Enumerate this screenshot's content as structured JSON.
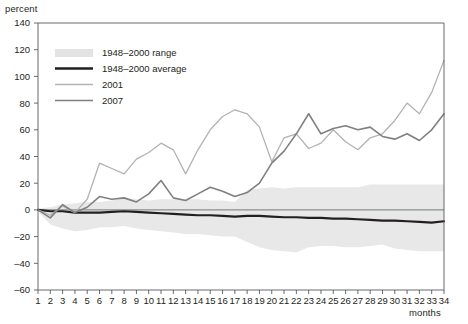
{
  "chart_data": {
    "type": "line",
    "title": "",
    "xlabel": "months",
    "ylabel": "percent",
    "ylim": [
      -60,
      140
    ],
    "xlim": [
      1,
      34
    ],
    "grid": false,
    "legend_position": "top-left",
    "y_ticks": [
      140,
      120,
      100,
      80,
      60,
      40,
      20,
      0,
      -20,
      -40,
      -60
    ],
    "x_ticks": [
      1,
      2,
      3,
      4,
      5,
      6,
      7,
      8,
      9,
      10,
      11,
      12,
      13,
      14,
      15,
      16,
      17,
      18,
      19,
      20,
      21,
      22,
      23,
      24,
      25,
      26,
      27,
      28,
      29,
      30,
      31,
      32,
      33,
      34
    ],
    "x": [
      1,
      2,
      3,
      4,
      5,
      6,
      7,
      8,
      9,
      10,
      11,
      12,
      13,
      14,
      15,
      16,
      17,
      18,
      19,
      20,
      21,
      22,
      23,
      24,
      25,
      26,
      27,
      28,
      29,
      30,
      31,
      32,
      33,
      34
    ],
    "legend": [
      {
        "label": "1948–2000 range",
        "kind": "band",
        "color": "#e3e3e3"
      },
      {
        "label": "1948–2000 average",
        "kind": "line",
        "color": "#231f20"
      },
      {
        "label": "2001",
        "kind": "line",
        "color": "#b3b3b3"
      },
      {
        "label": "2007",
        "kind": "line",
        "color": "#808080"
      }
    ],
    "band": {
      "name": "1948–2000 range",
      "color": "#e8e8e8",
      "upper": [
        1,
        2,
        4,
        5,
        6,
        6,
        7,
        9,
        8,
        7,
        8,
        8,
        8,
        8,
        7,
        7,
        6,
        15,
        16,
        17,
        16,
        17,
        17,
        17,
        17,
        17,
        17,
        19,
        19,
        19,
        19,
        19,
        19,
        19
      ],
      "lower": [
        -1,
        -11,
        -14,
        -16,
        -15,
        -13,
        -13,
        -12,
        -14,
        -15,
        -16,
        -17,
        -18,
        -18,
        -19,
        -20,
        -20,
        -24,
        -28,
        -30,
        -31,
        -32,
        -28,
        -27,
        -27,
        -28,
        -28,
        -27,
        -26,
        -29,
        -30,
        -31,
        -31,
        -31
      ]
    },
    "series": [
      {
        "name": "1948–2000 average",
        "color": "#231f20",
        "width": 2.2,
        "values": [
          0,
          -1,
          -1,
          -2,
          -2,
          -2,
          -1.5,
          -1,
          -1.5,
          -2,
          -2.5,
          -3,
          -3.5,
          -4,
          -4,
          -4.5,
          -5,
          -4.5,
          -4.5,
          -5,
          -5.5,
          -5.5,
          -6,
          -6,
          -6.5,
          -6.5,
          -7,
          -7.5,
          -8,
          -8,
          -8.5,
          -9,
          -9.5,
          -8.5
        ]
      },
      {
        "name": "2001",
        "color": "#b3b3b3",
        "width": 1.3,
        "values": [
          0,
          -4,
          3,
          -2,
          8,
          35,
          31,
          27,
          38,
          43,
          50,
          45,
          27,
          45,
          60,
          70,
          75,
          72,
          62,
          36,
          54,
          57,
          46,
          50,
          60,
          51,
          45,
          54,
          57,
          67,
          80,
          72,
          88,
          112
        ]
      },
      {
        "name": "2007",
        "color": "#808080",
        "width": 1.6,
        "values": [
          0,
          -6,
          4,
          -2,
          2,
          10,
          8,
          9,
          6,
          12,
          22,
          9,
          7,
          12,
          17,
          14,
          10,
          13,
          20,
          35,
          44,
          57,
          72,
          57,
          61,
          63,
          60,
          62,
          55,
          53,
          57,
          52,
          60,
          72
        ]
      }
    ]
  }
}
